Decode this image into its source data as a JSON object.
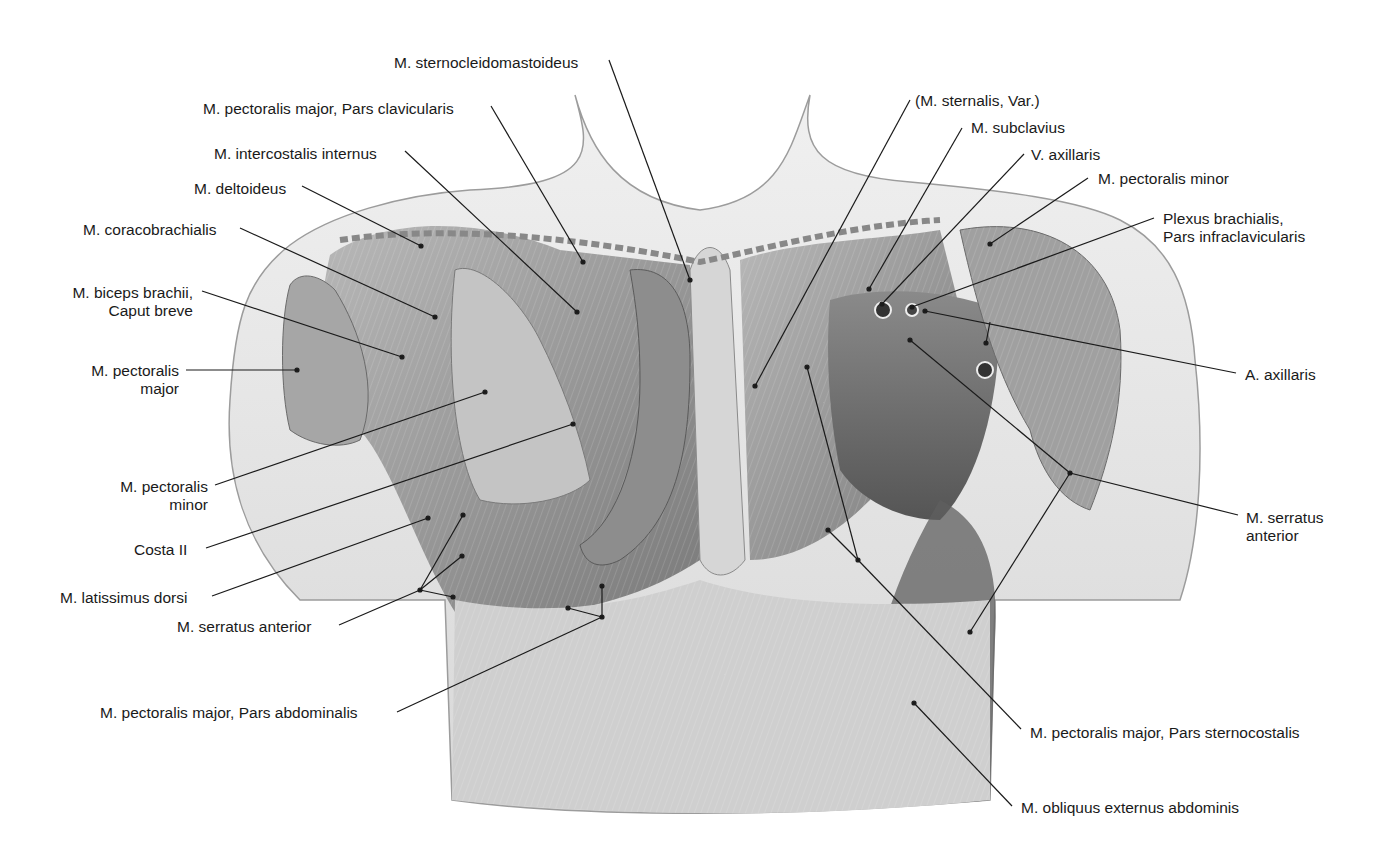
{
  "figure": {
    "type": "anatomical-illustration",
    "view": "anterior thorax, superficial and deep muscles",
    "colors": {
      "background": "#ffffff",
      "line": "#1a1a1a",
      "skin": "#e6e6e6",
      "muscle": "#9a9a9a",
      "muscle_dark": "#6e6e6e"
    }
  },
  "labels": [
    {
      "id": "sternocleidomastoideus",
      "text": "M. sternocleidomastoideus",
      "x": 394,
      "y": 54,
      "align": "left",
      "line": [
        [
          609,
          60
        ],
        [
          690,
          280
        ]
      ]
    },
    {
      "id": "pectoralis-major-clavicularis",
      "text": "M. pectoralis major, Pars clavicularis",
      "x": 203,
      "y": 100,
      "align": "left",
      "line": [
        [
          491,
          106
        ],
        [
          583,
          262
        ]
      ]
    },
    {
      "id": "intercostalis-internus",
      "text": "M. intercostalis internus",
      "x": 214,
      "y": 145,
      "align": "left",
      "line": [
        [
          405,
          151
        ],
        [
          577,
          312
        ]
      ]
    },
    {
      "id": "deltoideus",
      "text": "M. deltoideus",
      "x": 194,
      "y": 180,
      "align": "left",
      "line": [
        [
          302,
          186
        ],
        [
          421,
          246
        ]
      ]
    },
    {
      "id": "coracobrachialis",
      "text": "M. coracobrachialis",
      "x": 83,
      "y": 221,
      "align": "left",
      "line": [
        [
          240,
          228
        ],
        [
          435,
          317
        ]
      ]
    },
    {
      "id": "biceps-caput-breve",
      "text": "M. biceps brachii,\nCaput breve",
      "x": 58,
      "y": 284,
      "align": "right",
      "w": 135,
      "line": [
        [
          202,
          291
        ],
        [
          402,
          357
        ]
      ]
    },
    {
      "id": "pectoralis-major-left",
      "text": "M. pectoralis\nmajor",
      "x": 79,
      "y": 362,
      "align": "right",
      "w": 100,
      "line": [
        [
          186,
          370
        ],
        [
          297,
          370
        ]
      ]
    },
    {
      "id": "pectoralis-minor-left",
      "text": "M. pectoralis\nminor",
      "x": 108,
      "y": 478,
      "align": "right",
      "w": 100,
      "line": [
        [
          215,
          485
        ],
        [
          485,
          392
        ]
      ]
    },
    {
      "id": "costa-ii",
      "text": "Costa II",
      "x": 134,
      "y": 541,
      "align": "left",
      "line": [
        [
          206,
          548
        ],
        [
          573,
          424
        ]
      ]
    },
    {
      "id": "latissimus-dorsi",
      "text": "M. latissimus dorsi",
      "x": 60,
      "y": 589,
      "align": "left",
      "line": [
        [
          212,
          596
        ],
        [
          428,
          518
        ]
      ]
    },
    {
      "id": "serratus-anterior-left",
      "text": "M. serratus anterior",
      "x": 177,
      "y": 618,
      "align": "left",
      "line": [
        [
          339,
          625
        ],
        [
          420,
          590
        ]
      ],
      "branches": [
        [
          [
            420,
            590
          ],
          [
            463,
            515
          ]
        ],
        [
          [
            420,
            590
          ],
          [
            462,
            556
          ]
        ],
        [
          [
            420,
            590
          ],
          [
            453,
            597
          ]
        ]
      ]
    },
    {
      "id": "pectoralis-major-abdominalis",
      "text": "M. pectoralis major, Pars abdominalis",
      "x": 100,
      "y": 704,
      "align": "left",
      "line": [
        [
          397,
          712
        ],
        [
          602,
          617
        ]
      ],
      "branches": [
        [
          [
            602,
            617
          ],
          [
            602,
            586
          ]
        ],
        [
          [
            602,
            617
          ],
          [
            568,
            608
          ]
        ]
      ]
    },
    {
      "id": "sternalis-var",
      "text": "(M. sternalis, Var.)",
      "x": 915,
      "y": 92,
      "align": "left",
      "line": [
        [
          910,
          100
        ],
        [
          755,
          386
        ]
      ]
    },
    {
      "id": "subclavius",
      "text": "M. subclavius",
      "x": 971,
      "y": 119,
      "align": "left",
      "line": [
        [
          962,
          128
        ],
        [
          869,
          289
        ]
      ]
    },
    {
      "id": "v-axillaris",
      "text": "V. axillaris",
      "x": 1031,
      "y": 146,
      "align": "left",
      "line": [
        [
          1024,
          154
        ],
        [
          882,
          304
        ]
      ]
    },
    {
      "id": "pectoralis-minor-right",
      "text": "M. pectoralis minor",
      "x": 1098,
      "y": 170,
      "align": "left",
      "line": [
        [
          1088,
          178
        ],
        [
          990,
          244
        ]
      ]
    },
    {
      "id": "plexus-brachialis",
      "text": "Plexus brachialis,\nPars infraclavicularis",
      "x": 1163,
      "y": 210,
      "align": "left",
      "line": [
        [
          1154,
          218
        ],
        [
          912,
          307
        ]
      ]
    },
    {
      "id": "a-axillaris",
      "text": "A. axillaris",
      "x": 1245,
      "y": 366,
      "align": "left",
      "line": [
        [
          1236,
          373
        ],
        [
          925,
          311
        ]
      ],
      "branches": [
        [
          [
            990,
            322
          ],
          [
            986,
            343
          ]
        ]
      ]
    },
    {
      "id": "serratus-anterior-right",
      "text": "M. serratus\nanterior",
      "x": 1246,
      "y": 509,
      "align": "left",
      "line": [
        [
          1238,
          515
        ],
        [
          1070,
          473
        ]
      ],
      "branches": [
        [
          [
            1070,
            473
          ],
          [
            910,
            340
          ]
        ],
        [
          [
            1070,
            473
          ],
          [
            970,
            632
          ]
        ]
      ]
    },
    {
      "id": "pectoralis-major-sternocostalis",
      "text": "M. pectoralis major, Pars sternocostalis",
      "x": 1030,
      "y": 724,
      "align": "left",
      "line": [
        [
          1021,
          729
        ],
        [
          858,
          560
        ]
      ],
      "branches": [
        [
          [
            858,
            560
          ],
          [
            807,
            367
          ]
        ],
        [
          [
            858,
            560
          ],
          [
            828,
            530
          ]
        ]
      ]
    },
    {
      "id": "obliquus-externus-abdominis",
      "text": "M. obliquus externus abdominis",
      "x": 1021,
      "y": 799,
      "align": "left",
      "line": [
        [
          1012,
          806
        ],
        [
          914,
          703
        ]
      ]
    }
  ]
}
